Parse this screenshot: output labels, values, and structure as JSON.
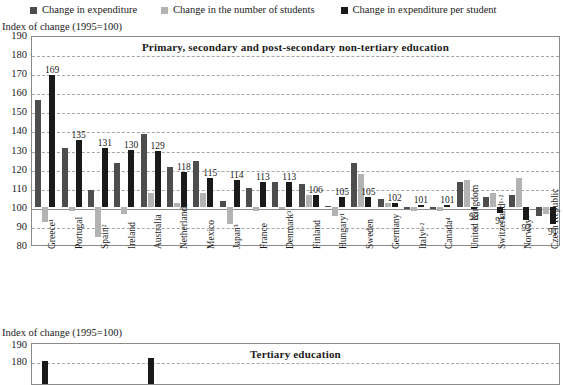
{
  "legend": {
    "items": [
      {
        "label": "Change in expenditure",
        "color": "#4d4d4d",
        "icon": "square-marker"
      },
      {
        "label": "Change in the number of students",
        "color": "#b3b3b3",
        "icon": "square-marker"
      },
      {
        "label": "Change in expenditure per student",
        "color": "#1a1a1a",
        "icon": "square-marker"
      }
    ]
  },
  "axis_caption_top": "Index of change (1995=100)",
  "axis_caption_bottom": "Index of change (1995=100)",
  "chart_data": [
    {
      "type": "bar",
      "title": "Primary, secondary and post-secondary non-tertiary education",
      "xlabel": "",
      "ylabel": "Index of change (1995=100)",
      "ylim": [
        80,
        190
      ],
      "yticks": [
        80,
        90,
        100,
        110,
        120,
        130,
        140,
        150,
        160,
        170,
        180,
        190
      ],
      "grid": true,
      "legend_position": "top",
      "baseline": 100,
      "categories": [
        "Greece¹",
        "Portugal",
        "Spain²",
        "Ireland",
        "Australia",
        "Netherlands",
        "Mexico",
        "Japan³",
        "France",
        "Denmark³",
        "Finland",
        "Hungary¹",
        "Sweden",
        "Germany",
        "Italy¹·²",
        "Canada⁴",
        "United Kingdom",
        "Switzerland¹·²",
        "Norway¹",
        "Czech Republic"
      ],
      "series": [
        {
          "name": "Change in expenditure",
          "color": "#4d4d4d",
          "values": [
            156,
            131,
            109,
            123,
            138,
            121,
            124,
            103,
            110,
            113,
            112,
            100,
            123,
            104,
            99,
            99,
            113,
            105,
            106,
            95
          ]
        },
        {
          "name": "Change in the number of students",
          "color": "#b3b3b3",
          "values": [
            92,
            98,
            84,
            96,
            107,
            102,
            107,
            91,
            98,
            99,
            106,
            95,
            117,
            102,
            98,
            98,
            114,
            107,
            115,
            96
          ]
        },
        {
          "name": "Change in expenditure per student",
          "color": "#1a1a1a",
          "values": [
            169,
            135,
            131,
            130,
            129,
            118,
            115,
            114,
            113,
            113,
            106,
            105,
            105,
            102,
            101,
            101,
            99,
            97,
            93,
            91
          ]
        }
      ],
      "data_labels": [
        "169",
        "135",
        "131",
        "130",
        "129",
        "118",
        "115",
        "114",
        "113",
        "113",
        "106",
        "105",
        "105",
        "102",
        "101",
        "101",
        "99",
        "97",
        "93",
        "91"
      ]
    },
    {
      "type": "bar",
      "title": "Tertiary education",
      "xlabel": "",
      "ylabel": "Index of change (1995=100)",
      "ylim": [
        170,
        190
      ],
      "yticks": [
        190,
        180
      ],
      "grid": true,
      "categories": [
        "c1",
        "c2",
        "c3",
        "c4",
        "c5",
        "c6",
        "c7",
        "c8",
        "c9",
        "c10",
        "c11",
        "c12",
        "c13",
        "c14",
        "c15",
        "c16",
        "c17",
        "c18",
        "c19",
        "c20"
      ],
      "series": [
        {
          "name": "Change in expenditure per student",
          "color": "#1a1a1a",
          "values": [
            180,
            null,
            null,
            null,
            182,
            null,
            null,
            null,
            null,
            null,
            null,
            null,
            null,
            null,
            null,
            null,
            null,
            null,
            null,
            null
          ]
        }
      ]
    }
  ]
}
